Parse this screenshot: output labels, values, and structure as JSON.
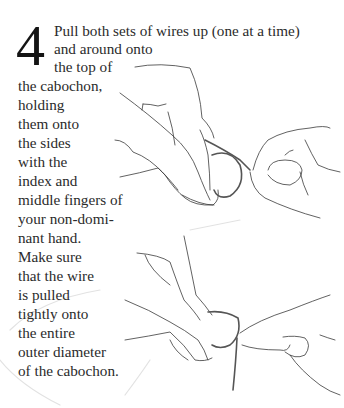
{
  "instruction": {
    "step_number": "4",
    "lines": [
      "Pull both sets of wires up (one at a time)",
      "and around onto",
      "the top of",
      "the cabochon,",
      "holding",
      "them onto",
      "the sides",
      "with the",
      "index and",
      "middle fingers of",
      "your non-domi-",
      "nant hand.",
      "Make sure",
      "that the wire",
      "is pulled",
      "tightly onto",
      "the entire",
      "outer diameter",
      "of the cabochon."
    ]
  },
  "illustrations": [
    {
      "name": "hands-wrapping-wire-top",
      "description": "Two hands holding a wire-wrapped cabochon, wires pulled up"
    },
    {
      "name": "hands-wrapping-wire-bottom",
      "description": "Two hands pulling wire tightly around cabochon"
    }
  ]
}
